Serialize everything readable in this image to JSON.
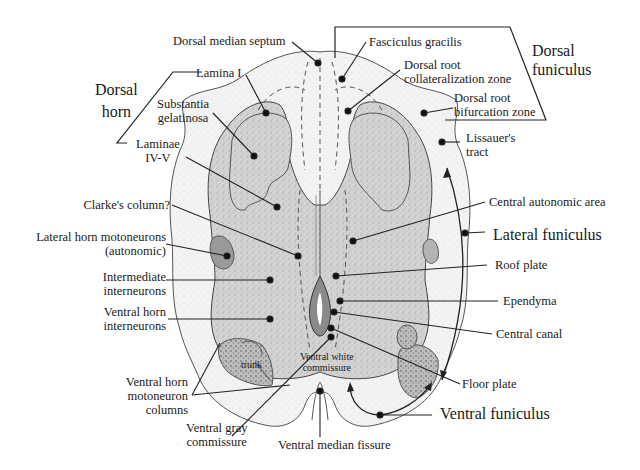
{
  "figure": {
    "colors": {
      "white_matter": "#f2f2f2",
      "gray_matter": "#cfcfcf",
      "dark_region": "#8e8e8e",
      "line": "#222222",
      "outline": "#555555"
    }
  },
  "groups": {
    "dorsal_horn": [
      "Dorsal",
      "horn"
    ],
    "dorsal_funiculus": [
      "Dorsal",
      "funiculus"
    ],
    "lateral_funiculus": "Lateral funiculus",
    "ventral_funiculus": "Ventral funiculus"
  },
  "labels": {
    "dorsal_median_septum": "Dorsal median septum",
    "fasciculus_gracilis": "Fasciculus gracilis",
    "lamina_i": "Lamina I",
    "substantia_gelatinosa": [
      "Substantia",
      "gelatinosa"
    ],
    "laminae_iv_v": [
      "Laminae",
      "IV-V"
    ],
    "dorsal_root_collateralization_zone": [
      "Dorsal root",
      "collateralization zone"
    ],
    "dorsal_root_bifurcation_zone": [
      "Dorsal root",
      "bifurcation zone"
    ],
    "lissauers_tract": [
      "Lissauer's",
      "tract"
    ],
    "clarkes_column": "Clarke's column?",
    "central_autonomic_area": "Central autonomic area",
    "lateral_horn_motoneurons": [
      "Lateral horn motoneurons",
      "(autonomic)"
    ],
    "intermediate_interneurons": [
      "Intermediate",
      "interneurons"
    ],
    "roof_plate": "Roof plate",
    "ependyma": "Ependyma",
    "ventral_horn_interneurons": [
      "Ventral horn",
      "interneurons"
    ],
    "central_canal": "Central canal",
    "trunk": "trunk",
    "ventral_white_commissure": [
      "Ventral white",
      "commissure"
    ],
    "floor_plate": "Floor plate",
    "ventral_horn_motoneuron_columns": [
      "Ventral horn",
      "motoneuron",
      "columns"
    ],
    "ventral_gray_commissure": [
      "Ventral gray",
      "commissure"
    ],
    "ventral_median_fissure": "Ventral median fissure"
  }
}
